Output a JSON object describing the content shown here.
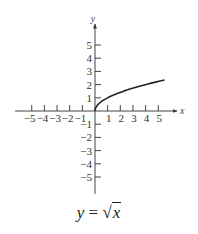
{
  "chart_data": {
    "type": "line",
    "title": "y = √x",
    "function": "sqrt(x)",
    "xlabel": "x",
    "ylabel": "y",
    "xlim": [
      -6,
      6.5
    ],
    "ylim": [
      -6.5,
      6.8
    ],
    "x_ticks": [
      -5,
      -4,
      -3,
      -2,
      -1,
      1,
      2,
      3,
      4,
      5
    ],
    "y_ticks": [
      -5,
      -4,
      -3,
      -2,
      -1,
      1,
      2,
      3,
      4,
      5
    ],
    "grid": false,
    "series": [
      {
        "name": "y = √x",
        "x": [
          0,
          0.25,
          0.5,
          1,
          1.5,
          2,
          2.5,
          3,
          3.5,
          4,
          4.5,
          5,
          5.5
        ],
        "y": [
          0,
          0.5,
          0.71,
          1,
          1.22,
          1.41,
          1.58,
          1.73,
          1.87,
          2,
          2.12,
          2.24,
          2.35
        ]
      }
    ],
    "color": "#222222"
  },
  "caption": {
    "lhs": "y",
    "equals": "=",
    "radical": "√",
    "radicand": "x"
  },
  "axes": {
    "x_name": "x",
    "y_name": "y"
  }
}
